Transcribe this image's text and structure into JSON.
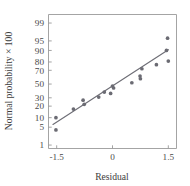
{
  "chart_data": {
    "type": "scatter",
    "title": "",
    "subtitle": "",
    "xlabel": "Residual",
    "ylabel": "Normal probability × 100",
    "grid": false,
    "legend": null,
    "x_scale": "linear",
    "y_scale": "probit",
    "xlim": [
      -1.72,
      1.72
    ],
    "ylim": [
      0.7,
      99.6
    ],
    "x_ticks": [
      -1.5,
      0,
      1.5
    ],
    "x_tick_labels": [
      "-1.5",
      "0",
      "1.5"
    ],
    "y_ticks": [
      1,
      5,
      10,
      20,
      30,
      50,
      70,
      80,
      90,
      95,
      99
    ],
    "y_tick_labels": [
      "1",
      "5",
      "10",
      "20",
      "30",
      "50",
      "70",
      "80",
      "90",
      "95",
      "99"
    ],
    "series": [
      {
        "name": "residual-quantiles",
        "type": "scatter",
        "marker": "circle",
        "color": "#6b6b73",
        "points": [
          {
            "x": -1.52,
            "y": 10.0
          },
          {
            "x": -1.52,
            "y": 4.0
          },
          {
            "x": -1.05,
            "y": 17.0
          },
          {
            "x": -0.79,
            "y": 27.0
          },
          {
            "x": -0.76,
            "y": 22.0
          },
          {
            "x": -0.37,
            "y": 31.0
          },
          {
            "x": -0.22,
            "y": 38.0
          },
          {
            "x": -0.05,
            "y": 36.0
          },
          {
            "x": 0.0,
            "y": 47.0
          },
          {
            "x": 0.03,
            "y": 44.0
          },
          {
            "x": 0.52,
            "y": 52.0
          },
          {
            "x": 0.74,
            "y": 62.0
          },
          {
            "x": 0.75,
            "y": 58.0
          },
          {
            "x": 0.79,
            "y": 72.0
          },
          {
            "x": 1.18,
            "y": 77.0
          },
          {
            "x": 1.45,
            "y": 90.0
          },
          {
            "x": 1.48,
            "y": 96.0
          },
          {
            "x": 1.5,
            "y": 81.0
          }
        ]
      },
      {
        "name": "reference-line",
        "type": "line",
        "color": "#6e6e76",
        "endpoints": [
          {
            "x": -1.6,
            "y": 6.2
          },
          {
            "x": 1.5,
            "y": 90.5
          }
        ]
      }
    ]
  },
  "axes": {
    "x_axis_name": "residual-axis",
    "y_axis_name": "normal-probability-axis"
  }
}
